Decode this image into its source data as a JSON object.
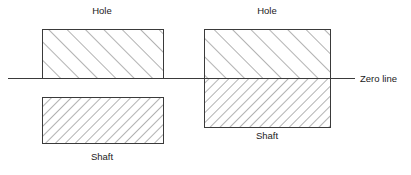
{
  "diagram": {
    "type": "engineering-tolerance-diagram",
    "width": 411,
    "height": 175,
    "background_color": "#ffffff",
    "line_color": "#3a3a3a",
    "hatch_color": "#555555",
    "text_color": "#1a1a1a"
  },
  "zero_line": {
    "label": "Zero line",
    "x1": 8,
    "x2": 355,
    "y": 78,
    "label_x": 360,
    "label_y": 74
  },
  "groups": [
    {
      "name": "clearance-fit",
      "hole": {
        "label": "Hole",
        "x": 42,
        "y": 29,
        "width": 121,
        "height": 49,
        "hatch_direction": "forward",
        "hatch_spacing": 13,
        "label_x": 102,
        "label_y": 6
      },
      "shaft": {
        "label": "Shaft",
        "x": 42,
        "y": 97,
        "width": 121,
        "height": 46,
        "hatch_direction": "backward",
        "hatch_spacing": 7,
        "label_x": 102,
        "label_y": 152
      }
    },
    {
      "name": "interference-fit",
      "hole": {
        "label": "Hole",
        "x": 204,
        "y": 29,
        "width": 126,
        "height": 49,
        "hatch_direction": "forward",
        "hatch_spacing": 13,
        "label_x": 267,
        "label_y": 6
      },
      "shaft": {
        "label": "Shaft",
        "x": 204,
        "y": 78,
        "width": 126,
        "height": 49,
        "hatch_direction": "backward",
        "hatch_spacing": 7,
        "label_x": 267,
        "label_y": 131
      }
    }
  ]
}
